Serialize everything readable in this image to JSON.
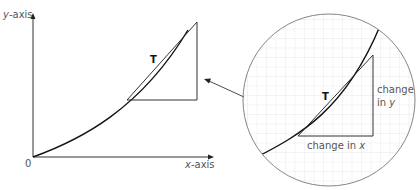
{
  "graph": {
    "y_axis_label_var": "y",
    "y_axis_label_rest": "-axis",
    "x_axis_label_var": "x",
    "x_axis_label_rest": "-axis",
    "origin_label": "0",
    "tangent_point_label": "T"
  },
  "magnified_view": {
    "tangent_point_label": "T",
    "change_in_y_line1": "change",
    "change_in_y_line2_prefix": "in ",
    "change_in_y_var": "y",
    "change_in_x_prefix": "change in ",
    "change_in_x_var": "x"
  },
  "colors": {
    "curve": "#111111",
    "axis": "#333333",
    "triangle": "#333333",
    "grid": "#dddddd",
    "circle": "#777777",
    "label_text": "#555555"
  }
}
